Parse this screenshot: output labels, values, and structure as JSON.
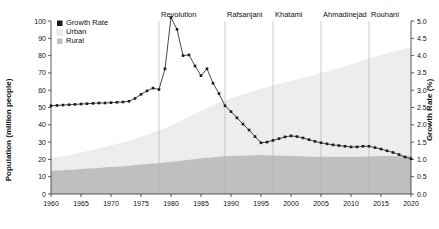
{
  "chart_data": {
    "type": "area",
    "title": "",
    "subtitle": "",
    "xlabel": "",
    "ylabel": "Population (million people)",
    "y2label": "Growth Rate (%)",
    "xlim": [
      1960,
      2020
    ],
    "ylim": [
      0,
      100
    ],
    "y2lim": [
      0.0,
      5.0
    ],
    "grid": false,
    "legend_position": "top-left",
    "x_ticks": [
      "1960",
      "1965",
      "1970",
      "1975",
      "1980",
      "1985",
      "1990",
      "1995",
      "2000",
      "2005",
      "2010",
      "2015",
      "2020"
    ],
    "y_ticks": [
      "0",
      "10",
      "20",
      "30",
      "40",
      "50",
      "60",
      "70",
      "80",
      "90",
      "100"
    ],
    "y2_ticks": [
      "0.0",
      "0.5",
      "1.0",
      "1.5",
      "2.0",
      "2.5",
      "3.0",
      "3.5",
      "4.0",
      "4.5",
      "5.0"
    ],
    "legend": [
      {
        "label": "Growth Rate",
        "swatch": "#1b1b1b",
        "kind": "line-marker"
      },
      {
        "label": "Urban",
        "swatch": "#ededed",
        "kind": "area"
      },
      {
        "label": "Rural",
        "swatch": "#bfbfbf",
        "kind": "area"
      }
    ],
    "annotations": [
      {
        "label": "Revolution",
        "x": 1978
      },
      {
        "label": "Rafsanjani",
        "x": 1989
      },
      {
        "label": "Khatami",
        "x": 1997
      },
      {
        "label": "Ahmadinejad",
        "x": 2005
      },
      {
        "label": "Rouhani",
        "x": 2013
      }
    ],
    "x": [
      1960,
      1961,
      1962,
      1963,
      1964,
      1965,
      1966,
      1967,
      1968,
      1969,
      1970,
      1971,
      1972,
      1973,
      1974,
      1975,
      1976,
      1977,
      1978,
      1979,
      1980,
      1981,
      1982,
      1983,
      1984,
      1985,
      1986,
      1987,
      1988,
      1989,
      1990,
      1991,
      1992,
      1993,
      1994,
      1995,
      1996,
      1997,
      1998,
      1999,
      2000,
      2001,
      2002,
      2003,
      2004,
      2005,
      2006,
      2007,
      2008,
      2009,
      2010,
      2011,
      2012,
      2013,
      2014,
      2015,
      2016,
      2017,
      2018,
      2019,
      2020
    ],
    "series": [
      {
        "name": "Growth Rate",
        "axis": "right",
        "unit": "%",
        "values": [
          2.55,
          2.56,
          2.57,
          2.58,
          2.59,
          2.6,
          2.61,
          2.62,
          2.63,
          2.63,
          2.64,
          2.65,
          2.66,
          2.68,
          2.76,
          2.88,
          2.98,
          3.06,
          3.02,
          3.62,
          5.1,
          4.76,
          4.0,
          4.02,
          3.7,
          3.42,
          3.62,
          3.2,
          2.9,
          2.55,
          2.38,
          2.2,
          2.02,
          1.85,
          1.66,
          1.48,
          1.5,
          1.55,
          1.6,
          1.65,
          1.68,
          1.66,
          1.62,
          1.57,
          1.52,
          1.48,
          1.45,
          1.42,
          1.4,
          1.38,
          1.36,
          1.36,
          1.38,
          1.38,
          1.34,
          1.3,
          1.25,
          1.2,
          1.14,
          1.07,
          1.02
        ]
      },
      {
        "name": "Rural",
        "axis": "left",
        "unit": "million people",
        "values": [
          13.4,
          13.6,
          13.8,
          14.0,
          14.2,
          14.4,
          14.7,
          14.9,
          15.1,
          15.4,
          15.6,
          15.9,
          16.1,
          16.4,
          16.7,
          17.0,
          17.3,
          17.6,
          17.9,
          18.2,
          18.6,
          19.0,
          19.4,
          19.8,
          20.2,
          20.6,
          21.0,
          21.3,
          21.6,
          21.8,
          22.0,
          22.1,
          22.2,
          22.3,
          22.4,
          22.5,
          22.4,
          22.3,
          22.2,
          22.1,
          22.0,
          21.9,
          21.8,
          21.7,
          21.6,
          21.5,
          21.5,
          21.5,
          21.5,
          21.5,
          21.6,
          21.6,
          21.7,
          21.8,
          21.8,
          21.9,
          21.9,
          22.0,
          22.0,
          22.1,
          22.1
        ]
      },
      {
        "name": "Urban",
        "axis": "left",
        "unit": "million people",
        "values": [
          7.4,
          7.8,
          8.2,
          8.6,
          9.1,
          9.6,
          10.1,
          10.6,
          11.2,
          11.8,
          12.4,
          13.1,
          13.8,
          14.5,
          15.3,
          16.1,
          17.0,
          17.9,
          18.9,
          19.9,
          21.0,
          22.2,
          23.5,
          24.8,
          26.1,
          27.4,
          28.7,
          29.9,
          31.1,
          32.2,
          33.3,
          34.4,
          35.4,
          36.4,
          37.4,
          38.4,
          39.4,
          40.4,
          41.4,
          42.4,
          43.4,
          44.4,
          45.4,
          46.4,
          47.4,
          48.4,
          49.4,
          50.4,
          51.4,
          52.4,
          53.4,
          54.4,
          55.4,
          56.4,
          57.4,
          58.4,
          59.3,
          60.2,
          61.0,
          61.8,
          62.5
        ]
      }
    ]
  }
}
